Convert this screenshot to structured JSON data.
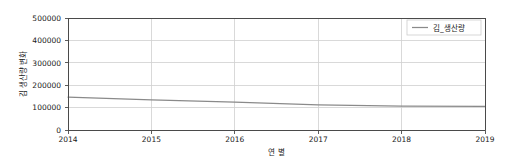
{
  "chart_data": {
    "type": "line",
    "title": "",
    "xlabel": "연 별",
    "ylabel": "김 생산량 변화",
    "x": [
      2014,
      2015,
      2016,
      2017,
      2018,
      2019
    ],
    "xtick_labels": [
      "2014",
      "2015",
      "2016",
      "2017",
      "2018",
      "2019"
    ],
    "ytick_labels": [
      "0",
      "100000",
      "200000",
      "300000",
      "400000",
      "500000"
    ],
    "ytick_values": [
      0,
      100000,
      200000,
      300000,
      400000,
      500000
    ],
    "ylim": [
      0,
      500000
    ],
    "xlim": [
      2014,
      2019
    ],
    "grid": true,
    "legend_position": "upper right",
    "series": [
      {
        "name": "김_생산량",
        "values": [
          147000,
          134000,
          124000,
          112000,
          107000,
          105000
        ],
        "color": "#8a8a8a"
      }
    ]
  },
  "legend": {
    "entries": [
      {
        "label": "김_생산량"
      }
    ]
  },
  "axes": {
    "x_title": "연 별",
    "y_title": "김 생산량 변화",
    "x_ticks": [
      "2014",
      "2015",
      "2016",
      "2017",
      "2018",
      "2019"
    ],
    "y_ticks": [
      "500000",
      "400000",
      "300000",
      "200000",
      "100000",
      "0"
    ]
  },
  "colors": {
    "line": "#8a8a8a",
    "grid": "#d0d0d0",
    "spine": "#4a4a4a",
    "text": "#1a1a1a",
    "background": "#ffffff"
  }
}
